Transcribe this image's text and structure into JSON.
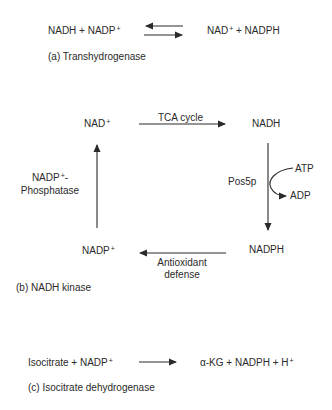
{
  "panel_a": {
    "left_reactants": "NADH + NADP",
    "left_sup": "+",
    "right_products_1": "NAD",
    "right_products_sup": "+",
    "right_products_2": " + NADPH",
    "arrow": "reversible",
    "caption": "(a) Transhydrogenase"
  },
  "panel_b": {
    "nodes": {
      "top_left": "NAD",
      "top_left_sup": "+",
      "top_right": "NADH",
      "bottom_right": "NADPH",
      "bottom_left": "NADP",
      "bottom_left_sup": "+"
    },
    "edges": {
      "top": "TCA cycle",
      "right_enzyme": "Pos5p",
      "right_cofactor_in": "ATP",
      "right_cofactor_out": "ADP",
      "bottom_line1": "Antioxidant",
      "bottom_line2": "defense",
      "left_line1": "NADP",
      "left_line1_sup": "+",
      "left_line1_suffix": "-",
      "left_line2": "Phosphatase"
    },
    "caption": "(b) NADH kinase"
  },
  "panel_c": {
    "reactants": "Isocitrate + NADP",
    "reactants_sup": "+",
    "products": "α-KG + NADPH + H",
    "products_sup": "+",
    "arrow": "forward",
    "caption": "(c) Isocitrate dehydrogenase"
  },
  "colors": {
    "ink": "#2a2a2a",
    "background": "#ffffff"
  }
}
